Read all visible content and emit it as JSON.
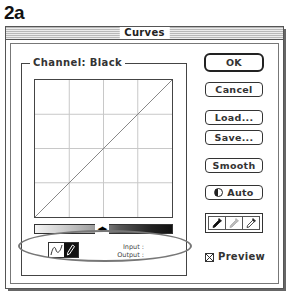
{
  "figure_label": "2a",
  "window": {
    "title": "Curves"
  },
  "channel": {
    "label": "Channel:",
    "value": "Black",
    "full_label": "Channel:  Black"
  },
  "graph": {
    "grid_divisions": 4,
    "curve": "linear-diagonal",
    "curve_points": [
      [
        0,
        0
      ],
      [
        255,
        255
      ]
    ]
  },
  "gradient_bar": {
    "direction": "light-to-dark",
    "toggle_icon": "direction-toggle-arrows-icon",
    "toggle_glyph": "◀▶"
  },
  "tools": [
    {
      "name": "curve-tool",
      "icon": "curve-icon",
      "active": false
    },
    {
      "name": "pencil-tool",
      "icon": "pencil-icon",
      "active": true
    }
  ],
  "readout": {
    "input_label": "Input :",
    "output_label": "Output :"
  },
  "buttons": {
    "ok": "OK",
    "cancel": "Cancel",
    "load": "Load...",
    "save": "Save...",
    "smooth": "Smooth",
    "auto": "Auto"
  },
  "eyedroppers": [
    {
      "name": "black-point",
      "icon": "eyedropper-black-icon"
    },
    {
      "name": "gray-point",
      "icon": "eyedropper-gray-icon"
    },
    {
      "name": "white-point",
      "icon": "eyedropper-white-icon"
    }
  ],
  "preview": {
    "label": "Preview",
    "checked": true
  },
  "colors": {
    "frame": "#444444",
    "highlight_ellipse": "#777777",
    "grid": "#c8c8c8"
  }
}
